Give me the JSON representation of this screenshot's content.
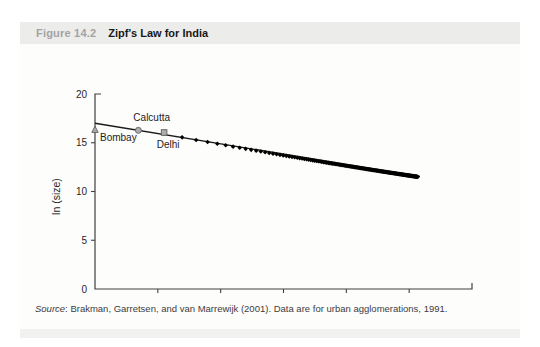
{
  "header": {
    "figure_label": "Figure 14.2",
    "title": "Zipf's Law for India"
  },
  "source_note": {
    "prefix": "Source",
    "text": ": Brakman, Garretsen, and van Marrewijk (2001). Data are for urban agglomerations, 1991."
  },
  "colors": {
    "page_bg": "#ffffff",
    "card_bg": "#fdfdfc",
    "header_bg": "#ececea",
    "footer_bg": "#f1f1ef",
    "figure_label": "#a3a3a3",
    "title_text": "#191919",
    "axis": "#404040",
    "tick_text": "#262626",
    "scatter": "#000000",
    "trendline": "#1a1a1a",
    "marker_fill": "#adadad",
    "marker_stroke": "#5f5f5f",
    "source_text": "#3c3c3c"
  },
  "chart_data": {
    "type": "scatter",
    "title": "Zipf's Law for India",
    "xlabel": "ln (rank)",
    "ylabel": "ln (size)",
    "xlim": [
      0,
      6
    ],
    "ylim": [
      0,
      20
    ],
    "x_ticks": [
      0,
      1,
      2,
      3,
      4,
      5,
      6
    ],
    "y_ticks": [
      0,
      5,
      10,
      15,
      20
    ],
    "grid": false,
    "legend": "none",
    "labeled_points": [
      {
        "label": "Bombay",
        "x": 0.0,
        "y": 16.35,
        "marker": "triangle",
        "label_dx": 5,
        "label_dy": 11,
        "anchor": "start"
      },
      {
        "label": "Calcutta",
        "x": 0.69,
        "y": 16.27,
        "marker": "circle",
        "label_dx": -5,
        "label_dy": -9,
        "anchor": "start"
      },
      {
        "label": "Delhi",
        "x": 1.1,
        "y": 16.05,
        "marker": "square",
        "label_dx": 4,
        "label_dy": 15,
        "anchor": "middle"
      }
    ],
    "series_rule": {
      "note": "black diamond points at x = ln(rank) for city ranks 4..170; y approximated by quadratic fit read from plot",
      "rank_from": 4,
      "rank_to": 170,
      "y_poly": [
        17.282,
        -1.2908,
        0.03227
      ],
      "first_point": {
        "x": 1.39,
        "y": 15.55
      },
      "last_point": {
        "x": 5.14,
        "y": 11.5
      }
    },
    "trendline": {
      "x1": 0,
      "y1": 17.0,
      "x2": 5.17,
      "y2": 11.55,
      "slope": -1.05,
      "intercept": 17.0
    }
  }
}
